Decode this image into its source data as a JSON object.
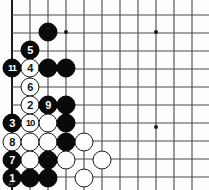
{
  "diagram": {
    "type": "go-board-diagram",
    "board": {
      "origin_x": 12,
      "origin_y": 15,
      "spacing": 18,
      "cols": 11,
      "rows": 10,
      "line_color": "#4a4a4a",
      "edge_color": "#1a1a1a",
      "background": "#fdfdfd",
      "star_points": [
        {
          "x": 66,
          "y": 32
        },
        {
          "x": 156,
          "y": 32
        },
        {
          "x": 156,
          "y": 127
        }
      ]
    },
    "stones": [
      {
        "id": "stone-b-1",
        "color": "black",
        "x": 48,
        "y": 32,
        "label": ""
      },
      {
        "id": "stone-b-2",
        "color": "black",
        "x": 30,
        "y": 50,
        "label": "5"
      },
      {
        "id": "stone-b-3",
        "color": "black",
        "x": 12,
        "y": 68,
        "label": "11"
      },
      {
        "id": "stone-w-1",
        "color": "white",
        "x": 30,
        "y": 68,
        "label": "4"
      },
      {
        "id": "stone-b-4",
        "color": "black",
        "x": 48,
        "y": 68,
        "label": ""
      },
      {
        "id": "stone-b-5",
        "color": "black",
        "x": 66,
        "y": 68,
        "label": ""
      },
      {
        "id": "stone-w-2",
        "color": "white",
        "x": 30,
        "y": 87,
        "label": "6"
      },
      {
        "id": "stone-w-3",
        "color": "white",
        "x": 30,
        "y": 105,
        "label": "2"
      },
      {
        "id": "stone-b-6",
        "color": "black",
        "x": 48,
        "y": 105,
        "label": "9"
      },
      {
        "id": "stone-b-7",
        "color": "black",
        "x": 66,
        "y": 105,
        "label": ""
      },
      {
        "id": "stone-b-8",
        "color": "black",
        "x": 12,
        "y": 123,
        "label": "3"
      },
      {
        "id": "stone-w-4",
        "color": "white",
        "x": 30,
        "y": 123,
        "label": "10"
      },
      {
        "id": "stone-w-5",
        "color": "white",
        "x": 48,
        "y": 123,
        "label": ""
      },
      {
        "id": "stone-b-9",
        "color": "black",
        "x": 66,
        "y": 123,
        "label": ""
      },
      {
        "id": "stone-w-6",
        "color": "white",
        "x": 12,
        "y": 142,
        "label": "8"
      },
      {
        "id": "stone-w-7",
        "color": "white",
        "x": 30,
        "y": 142,
        "label": ""
      },
      {
        "id": "stone-w-8",
        "color": "white",
        "x": 48,
        "y": 142,
        "label": ""
      },
      {
        "id": "stone-b-10",
        "color": "black",
        "x": 66,
        "y": 142,
        "label": ""
      },
      {
        "id": "stone-w-9",
        "color": "white",
        "x": 84,
        "y": 142,
        "label": ""
      },
      {
        "id": "stone-b-11",
        "color": "black",
        "x": 12,
        "y": 160,
        "label": "7"
      },
      {
        "id": "stone-w-10",
        "color": "white",
        "x": 30,
        "y": 160,
        "label": ""
      },
      {
        "id": "stone-b-12",
        "color": "black",
        "x": 48,
        "y": 160,
        "label": ""
      },
      {
        "id": "stone-w-11",
        "color": "white",
        "x": 66,
        "y": 160,
        "label": ""
      },
      {
        "id": "stone-w-12",
        "color": "white",
        "x": 102,
        "y": 160,
        "label": ""
      },
      {
        "id": "stone-b-13",
        "color": "black",
        "x": 12,
        "y": 178,
        "label": "1"
      },
      {
        "id": "stone-b-14",
        "color": "black",
        "x": 30,
        "y": 178,
        "label": ""
      },
      {
        "id": "stone-b-15",
        "color": "black",
        "x": 48,
        "y": 178,
        "label": ""
      },
      {
        "id": "stone-w-13",
        "color": "white",
        "x": 84,
        "y": 178,
        "label": ""
      }
    ],
    "move_numbers": [
      "1",
      "2",
      "3",
      "4",
      "5",
      "6",
      "7",
      "8",
      "9",
      "10",
      "11"
    ],
    "corner_mark": "↵"
  }
}
